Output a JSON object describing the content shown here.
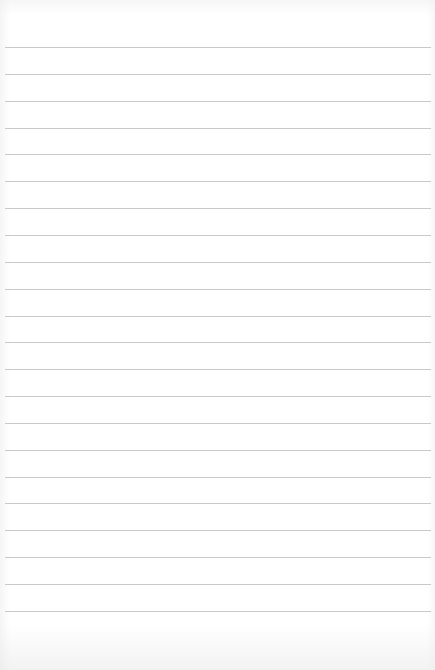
{
  "page": {
    "type": "blank lined paper",
    "background_color": "#ffffff",
    "rule_color": "#c9c9c9",
    "rule_count": 22,
    "first_rule_y": 47,
    "rule_spacing": 26.85,
    "rule_left": 5,
    "rule_right_inset": 4
  }
}
